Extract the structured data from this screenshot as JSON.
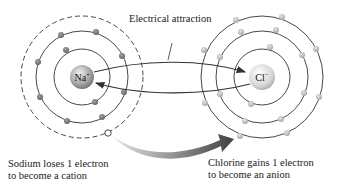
{
  "diagram": {
    "title_label": "Electrical attraction",
    "sodium": {
      "symbol": "Na",
      "charge": "+",
      "caption_line1": "Sodium loses 1 electron",
      "caption_line2": "to become a cation"
    },
    "chlorine": {
      "symbol": "Cl",
      "charge": "−",
      "caption_line1": "Chlorine gains 1 electron",
      "caption_line2": "to become an anion"
    },
    "colors": {
      "orbit": "#333333",
      "sodium_electron": "#6b7a6e",
      "chlorine_electron": "#b8c0b8",
      "ion_fill": "#c8c8c8",
      "arrow_dark": "#3a3a3a",
      "arrow_light": "#d8d8d8"
    }
  }
}
